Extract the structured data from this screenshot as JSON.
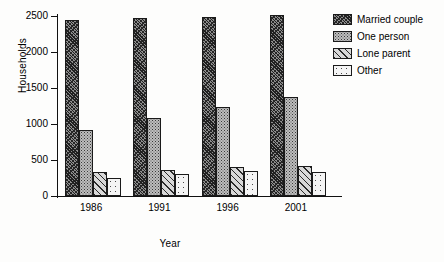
{
  "chart_data": {
    "type": "bar",
    "title": "",
    "xlabel": "Year",
    "ylabel": "Households",
    "categories": [
      "1986",
      "1991",
      "1996",
      "2001"
    ],
    "ylim": [
      0,
      2500
    ],
    "yticks": [
      0,
      500,
      1000,
      1500,
      2000,
      2500
    ],
    "grid": false,
    "legend_position": "top-right",
    "series": [
      {
        "name": "Married couple",
        "pattern": "dense-crosshatch",
        "values": [
          2450,
          2470,
          2490,
          2510
        ]
      },
      {
        "name": "One person",
        "pattern": "grey-stipple",
        "values": [
          910,
          1080,
          1230,
          1370
        ]
      },
      {
        "name": "Lone parent",
        "pattern": "diagonal-lines",
        "values": [
          330,
          360,
          400,
          420
        ]
      },
      {
        "name": "Other",
        "pattern": "light-speckle",
        "values": [
          255,
          310,
          350,
          340
        ]
      }
    ]
  },
  "axes": {
    "ylabel": "Households",
    "xlabel": "Year",
    "ytick_labels": [
      "2500",
      "2000",
      "1500",
      "1000",
      "500",
      "0"
    ],
    "xtick_labels": [
      "1986",
      "1991",
      "1996",
      "2001"
    ]
  },
  "legend": {
    "items": [
      {
        "label": "Married couple"
      },
      {
        "label": "One person"
      },
      {
        "label": "Lone parent"
      },
      {
        "label": "Other"
      }
    ]
  }
}
